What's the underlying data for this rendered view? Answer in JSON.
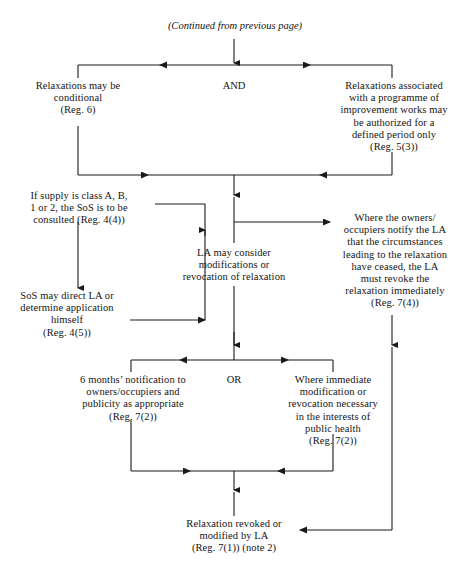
{
  "diagram": {
    "title_note": "(Continued from previous page)",
    "operators": {
      "and": "AND",
      "or": "OR"
    },
    "nodes": {
      "relaxations_conditional": "Relaxations may be\nconditional\n(Reg. 6)",
      "relaxations_programme": "Relaxations associated\nwith a programme of\nimprovement works may\nbe authorized for a\ndefined period only\n(Reg. 5(3))",
      "supply_class": "If supply is class A, B,\n1 or 2, the SoS is to be\nconsulted (Reg. 4(4))",
      "sos_direct": "SoS may direct LA or\ndetermine application\nhimself\n(Reg. 4(5))",
      "la_may_consider": "LA may consider\nmodifications or\nrevocation of relaxation",
      "owners_notify": "Where the owners/\noccupiers notify the LA\nthat the circumstances\nleading to the relaxation\nhave ceased, the LA\nmust revoke the\nrelaxation immediately\n(Reg. 7(4))",
      "six_months": "6 months’ notification to\nowners/occupiers and\npublicity as appropriate\n(Reg. 7(2))",
      "immediate_modification": "Where immediate\nmodification or\nrevocation necessary\nin the interests of\npublic health\n(Reg. 7(2))",
      "relaxation_revoked": "Relaxation revoked or\nmodified by LA\n(Reg. 7(1)) (note 2)"
    },
    "line_color": "#1a1a1a"
  }
}
